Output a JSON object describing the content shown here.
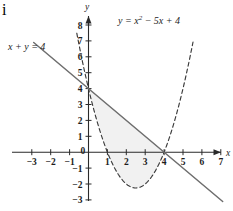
{
  "figure": {
    "corner_mark": "i",
    "line_label": "x + y = 4",
    "parabola_label_prefix": "y = x",
    "parabola_label_exponent": "2",
    "parabola_label_suffix": " − 5x + 4",
    "x_axis_name": "x",
    "y_axis_name": "y",
    "shade_color": "#f1f1f1",
    "line_color": "#6e6e6e",
    "curve_color": "#3a3a3a",
    "axis_color": "#2a2a2a"
  },
  "chart_data": {
    "type": "line",
    "title": "",
    "xlabel": "x",
    "ylabel": "y",
    "xlim": [
      -3.6,
      7.6
    ],
    "ylim": [
      -3.6,
      8.6
    ],
    "grid": false,
    "legend": "inline-annotations",
    "x_ticks": [
      -3,
      -2,
      -1,
      0,
      1,
      2,
      3,
      4,
      5,
      6,
      7
    ],
    "x_tick_labels": [
      "−3",
      "−2",
      "−1",
      "0",
      "1",
      "2",
      "3",
      "4",
      "5",
      "6",
      "7"
    ],
    "y_ticks": [
      -3,
      -2,
      -1,
      1,
      2,
      3,
      4,
      5,
      6,
      7,
      8
    ],
    "y_tick_labels": [
      "−3",
      "−2",
      "−1",
      "1",
      "2",
      "3",
      "4",
      "5",
      "6",
      "7",
      "8"
    ],
    "series": [
      {
        "name": "x + y = 4",
        "style": "solid",
        "equation": "y = 4 - x",
        "x": [
          -2.9,
          7.1
        ],
        "values": [
          6.9,
          -3.1
        ]
      },
      {
        "name": "y = x^2 - 5x + 4",
        "style": "dashed",
        "equation": "y = x^2 - 5x + 4",
        "vertex": [
          2.5,
          -2.25
        ],
        "roots": [
          1,
          4
        ],
        "y_intercept": 4,
        "x": [
          -0.62,
          0,
          0.5,
          1,
          1.5,
          2,
          2.5,
          3,
          3.5,
          4,
          4.5,
          5,
          5.55
        ],
        "values": [
          7.48,
          4,
          1.75,
          0,
          -1.25,
          -2,
          -2.25,
          -2,
          -1.25,
          0,
          1.75,
          4,
          6.56
        ]
      }
    ],
    "annotations": [
      {
        "text": "x + y = 4",
        "x": -2.6,
        "y": 5.9
      },
      {
        "text": "y = x² − 5x + 4",
        "x": 3.2,
        "y": 8.1
      }
    ],
    "shaded_region": {
      "description": "Region bounded above by the line x + y = 4 and below by the parabola y = x^2 - 5x + 4, between their intersection points x = 0 and x = 4",
      "x_from": 0,
      "x_to": 4,
      "upper_curve": "x + y = 4",
      "lower_curve": "y = x^2 - 5x + 4"
    },
    "intersections": [
      [
        0,
        4
      ],
      [
        4,
        0
      ]
    ]
  }
}
